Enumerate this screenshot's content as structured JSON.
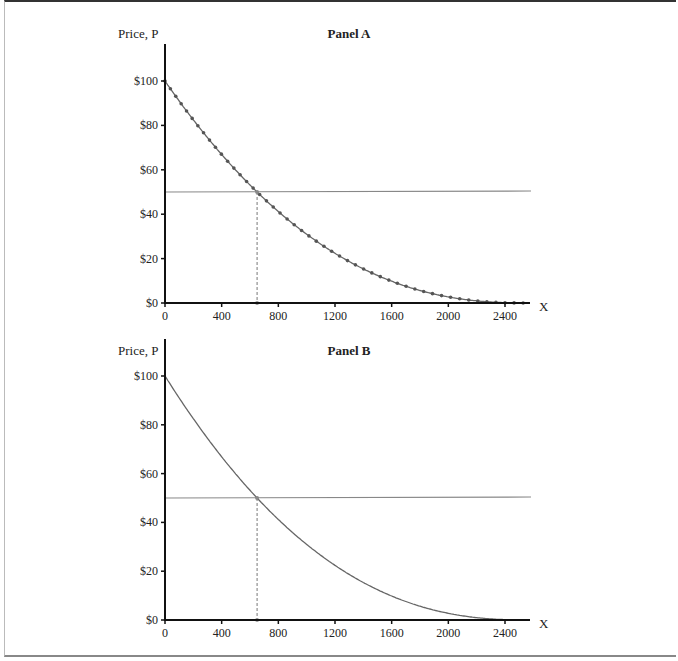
{
  "chart_data": [
    {
      "type": "line",
      "title": "Panel A",
      "ylabel": "Price, P",
      "xlabel": "X",
      "x_ticks": [
        0,
        400,
        800,
        1200,
        1600,
        2000,
        2400
      ],
      "y_ticks": [
        "$0",
        "$20",
        "$40",
        "$60",
        "$80",
        "$100"
      ],
      "xlim": [
        0,
        2600
      ],
      "ylim": [
        0,
        100
      ],
      "series": [
        {
          "name": "Demand curve (markers)",
          "style": "line-with-dots",
          "x": [
            0,
            400,
            650,
            800,
            1200,
            1600,
            2000,
            2400,
            2560
          ],
          "y": [
            100,
            67.5,
            50,
            41.5,
            26.5,
            14.5,
            6,
            1,
            0
          ]
        },
        {
          "name": "Price line",
          "style": "horizontal",
          "y": 50
        }
      ],
      "annotations": [
        {
          "type": "dashed-vertical",
          "x": 650,
          "from_y": 0,
          "to_y": 50
        }
      ]
    },
    {
      "type": "line",
      "title": "Panel B",
      "ylabel": "Price, P",
      "xlabel": "X",
      "x_ticks": [
        0,
        400,
        800,
        1200,
        1600,
        2000,
        2400
      ],
      "y_ticks": [
        "$0",
        "$20",
        "$40",
        "$60",
        "$80",
        "$100"
      ],
      "xlim": [
        0,
        2600
      ],
      "ylim": [
        0,
        100
      ],
      "series": [
        {
          "name": "Demand curve",
          "style": "smooth-line",
          "x": [
            0,
            400,
            650,
            800,
            1200,
            1600,
            2000,
            2400,
            2560
          ],
          "y": [
            100,
            67.5,
            50,
            41.5,
            26.5,
            14.5,
            6,
            1,
            0
          ]
        },
        {
          "name": "Price line",
          "style": "horizontal",
          "y": 50
        }
      ],
      "annotations": [
        {
          "type": "dashed-vertical",
          "x": 650,
          "from_y": 0,
          "to_y": 50
        }
      ]
    }
  ],
  "panels": [
    {
      "title": "Panel A",
      "ylabel": "Price, P",
      "xlabel": "X"
    },
    {
      "title": "Panel B",
      "ylabel": "Price, P",
      "xlabel": "X"
    }
  ]
}
